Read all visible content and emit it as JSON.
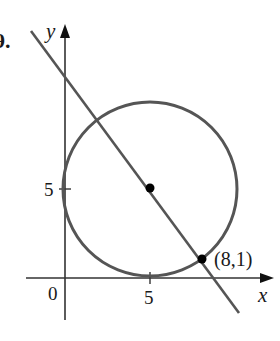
{
  "problem_number": "9.",
  "axes": {
    "x_label": "x",
    "y_label": "y",
    "origin_label": "0",
    "x_tick_label": "5",
    "y_tick_label": "5"
  },
  "circle": {
    "center": [
      5,
      5
    ],
    "radius": 5
  },
  "tangent_point": {
    "label": "(8,1)",
    "coords": [
      8,
      1
    ]
  },
  "colors": {
    "curve": "#555555",
    "axis": "#333333",
    "point": "#000000"
  }
}
